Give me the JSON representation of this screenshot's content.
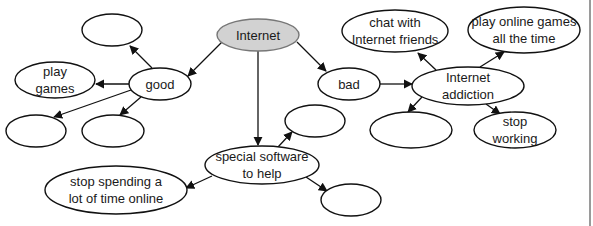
{
  "diagram": {
    "type": "mind-map",
    "nodes": [
      {
        "id": "internet",
        "lines": [
          "Internet"
        ],
        "cx": 258,
        "cy": 35,
        "rx": 41,
        "ry": 16,
        "fill": "#d2d2d2"
      },
      {
        "id": "good",
        "lines": [
          "good"
        ],
        "cx": 160,
        "cy": 84,
        "rx": 31,
        "ry": 16
      },
      {
        "id": "bad",
        "lines": [
          "bad"
        ],
        "cx": 349,
        "cy": 84,
        "rx": 31,
        "ry": 16
      },
      {
        "id": "good-empty-top",
        "lines": [],
        "cx": 112,
        "cy": 30,
        "rx": 30,
        "ry": 16
      },
      {
        "id": "play-games",
        "lines": [
          "play",
          "games"
        ],
        "cx": 55,
        "cy": 80,
        "rx": 40,
        "ry": 18
      },
      {
        "id": "good-empty-left",
        "lines": [],
        "cx": 36,
        "cy": 131,
        "rx": 30,
        "ry": 16
      },
      {
        "id": "good-empty-mid",
        "lines": [],
        "cx": 113,
        "cy": 131,
        "rx": 31,
        "ry": 16
      },
      {
        "id": "chat-with-friends",
        "lines": [
          "chat with",
          "Internet friends"
        ],
        "cx": 395,
        "cy": 31,
        "rx": 53,
        "ry": 21
      },
      {
        "id": "play-online-games",
        "lines": [
          "play online games",
          "all the time"
        ],
        "cx": 524,
        "cy": 30,
        "rx": 56,
        "ry": 23
      },
      {
        "id": "internet-addiction",
        "lines": [
          "Internet",
          "addiction"
        ],
        "cx": 468,
        "cy": 86,
        "rx": 56,
        "ry": 19
      },
      {
        "id": "addiction-empty",
        "lines": [],
        "cx": 411,
        "cy": 130,
        "rx": 41,
        "ry": 18
      },
      {
        "id": "stop-working",
        "lines": [
          "stop",
          "working"
        ],
        "cx": 515,
        "cy": 130,
        "rx": 41,
        "ry": 18
      },
      {
        "id": "special-software",
        "lines": [
          "special software",
          "to help"
        ],
        "cx": 262,
        "cy": 165,
        "rx": 57,
        "ry": 19
      },
      {
        "id": "software-empty-top",
        "lines": [],
        "cx": 315,
        "cy": 121,
        "rx": 30,
        "ry": 16
      },
      {
        "id": "software-empty-bottom",
        "lines": [],
        "cx": 351,
        "cy": 200,
        "rx": 30,
        "ry": 16
      },
      {
        "id": "stop-spending",
        "lines": [
          "stop spending a",
          "lot of time online"
        ],
        "cx": 116,
        "cy": 190,
        "rx": 71,
        "ry": 24
      }
    ],
    "edges": [
      {
        "from": "internet",
        "to": "good",
        "x1": 222,
        "y1": 42,
        "x2": 188,
        "y2": 76
      },
      {
        "from": "internet",
        "to": "bad",
        "x1": 297,
        "y1": 42,
        "x2": 326,
        "y2": 71
      },
      {
        "from": "internet",
        "to": "special-software",
        "x1": 258,
        "y1": 51,
        "x2": 258,
        "y2": 145
      },
      {
        "from": "good",
        "to": "good-empty-top",
        "x1": 152,
        "y1": 68,
        "x2": 130,
        "y2": 46
      },
      {
        "from": "good",
        "to": "play-games",
        "x1": 130,
        "y1": 84,
        "x2": 96,
        "y2": 84
      },
      {
        "from": "good",
        "to": "good-empty-left",
        "x1": 131,
        "y1": 90,
        "x2": 54,
        "y2": 117
      },
      {
        "from": "good",
        "to": "good-empty-mid",
        "x1": 141,
        "y1": 97,
        "x2": 120,
        "y2": 115
      },
      {
        "from": "bad",
        "to": "internet-addiction",
        "x1": 380,
        "y1": 84,
        "x2": 412,
        "y2": 84
      },
      {
        "from": "internet-addiction",
        "to": "chat-with-friends",
        "x1": 436,
        "y1": 70,
        "x2": 418,
        "y2": 53
      },
      {
        "from": "internet-addiction",
        "to": "play-online-games",
        "x1": 480,
        "y1": 67,
        "x2": 504,
        "y2": 52
      },
      {
        "from": "internet-addiction",
        "to": "addiction-empty",
        "x1": 422,
        "y1": 97,
        "x2": 408,
        "y2": 112
      },
      {
        "from": "internet-addiction",
        "to": "stop-working",
        "x1": 486,
        "y1": 104,
        "x2": 500,
        "y2": 114
      },
      {
        "from": "special-software",
        "to": "software-empty-top",
        "x1": 278,
        "y1": 147,
        "x2": 292,
        "y2": 132
      },
      {
        "from": "special-software",
        "to": "stop-spending",
        "x1": 212,
        "y1": 176,
        "x2": 186,
        "y2": 188
      },
      {
        "from": "special-software",
        "to": "software-empty-bottom",
        "x1": 306,
        "y1": 177,
        "x2": 327,
        "y2": 191
      }
    ]
  }
}
